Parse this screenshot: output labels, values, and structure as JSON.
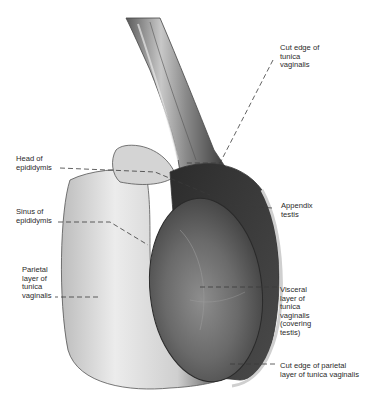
{
  "figure": {
    "type": "anatomical illustration",
    "colors": {
      "background": "#ffffff",
      "label_text": "#2a2a2a",
      "leader_line": "#3a3a3a",
      "light_tissue": "#d9d9d9",
      "dark_tissue": "#3c3c3c"
    }
  },
  "labels": [
    {
      "id": "cut-edge-tunica-vaginalis",
      "text": "Cut edge of\ntunica\nvaginalis"
    },
    {
      "id": "head-of-epididymis",
      "text": "Head of\nepididymis"
    },
    {
      "id": "appendix-testis",
      "text": "Appendix\ntestis"
    },
    {
      "id": "sinus-of-epididymis",
      "text": "Sinus of\nepididymis"
    },
    {
      "id": "parietal-layer",
      "text": "Parietal\nlayer of\ntunica\nvaginalis"
    },
    {
      "id": "visceral-layer",
      "text": "Visceral\nlayer of\ntunica\nvaginalis\n(covering\ntestis)"
    },
    {
      "id": "cut-edge-parietal",
      "text": "Cut edge of parietal\nlayer of tunica vaginalis"
    }
  ]
}
